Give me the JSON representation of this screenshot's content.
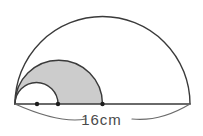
{
  "figure": {
    "dimension_label": "16cm",
    "colors": {
      "stroke": "#3a3a3a",
      "shade_fill": "#cccccc",
      "background": "#ffffff",
      "label_text": "#4a4a4a",
      "dimension_line": "#6b6b6b"
    },
    "baseline": {
      "label": "baseline",
      "x1": 15,
      "y1": 104,
      "x2": 190,
      "y2": 104,
      "length_px": 175,
      "measured_value": "16cm"
    },
    "semicircles": [
      {
        "name": "large-semicircle",
        "fill": "none",
        "center_x": 102.5,
        "center_y": 104,
        "radius": 87.5,
        "start_x": 15,
        "end_x": 190,
        "apex_y": 16.5
      },
      {
        "name": "medium-semicircle",
        "fill": "#cccccc",
        "center_x": 58.75,
        "center_y": 104,
        "radius": 43.75,
        "start_x": 15,
        "end_x": 102.5,
        "apex_y": 60.25
      },
      {
        "name": "small-semicircle",
        "fill": "#ffffff",
        "center_x": 36.5,
        "center_y": 104,
        "radius": 21.5,
        "start_x": 15,
        "end_x": 58,
        "apex_y": 82.5
      }
    ],
    "points": [
      {
        "name": "point-small-center",
        "x": 37,
        "y": 104
      },
      {
        "name": "point-small-end",
        "x": 58,
        "y": 104
      },
      {
        "name": "point-medium-end",
        "x": 102.5,
        "y": 104
      }
    ],
    "dimension_arc": {
      "name": "dimension-measure-arc",
      "start_x": 15,
      "start_y": 104,
      "end_x": 190,
      "end_y": 104,
      "sag_y": 122
    }
  }
}
